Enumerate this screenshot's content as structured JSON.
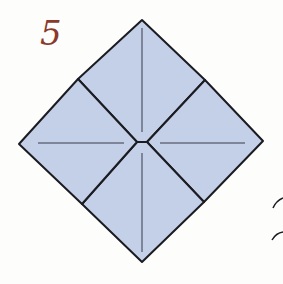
{
  "diagram": {
    "step_number": "5",
    "fill_color": "#c4d0e8",
    "stroke_color": "#1b1b22",
    "fold_line_color": "#3a3a4a",
    "step_color": "#8a3a2c"
  }
}
